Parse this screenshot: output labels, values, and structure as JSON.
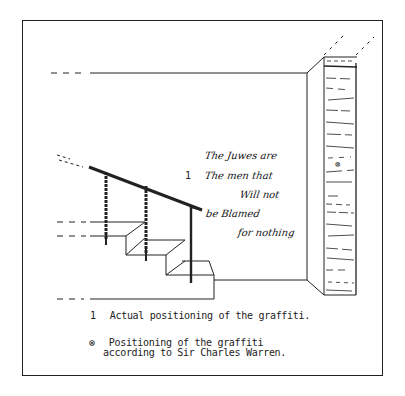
{
  "diagram": {
    "wall_graffiti_lines": [
      "The Juwes are",
      "The men that",
      "Will not",
      "be Blamed",
      "for nothing"
    ],
    "position_marker_1": "1",
    "warren_marker": "⊗"
  },
  "legend": {
    "items": [
      {
        "marker": "1",
        "text": "Actual positioning of the graffiti."
      },
      {
        "marker": "⊗",
        "text_line1": "Positioning of the graffiti",
        "text_line2": "according to Sir Charles Warren."
      }
    ]
  }
}
